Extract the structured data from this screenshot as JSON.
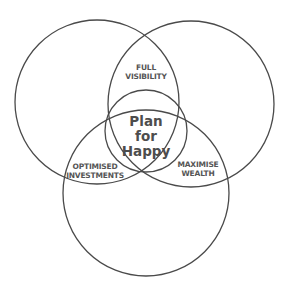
{
  "diagram": {
    "type": "venn",
    "circles": [
      {
        "id": "left",
        "cx": 97,
        "cy": 102,
        "r": 82
      },
      {
        "id": "right",
        "cx": 191,
        "cy": 104,
        "r": 83
      },
      {
        "id": "bottom",
        "cx": 146,
        "cy": 193,
        "r": 83
      },
      {
        "id": "center",
        "cx": 146,
        "cy": 131,
        "r": 41
      }
    ],
    "stroke_color": "#4a4a4a",
    "text_color": "#555555"
  },
  "labels": {
    "top_overlap": {
      "line1": "FULL",
      "line2": "VISIBILITY"
    },
    "left_overlap": {
      "line1": "OPTIMISED",
      "line2": "INVESTMENTS"
    },
    "right_overlap": {
      "line1": "MAXIMISE",
      "line2": "WEALTH"
    },
    "center": {
      "line1": "Plan",
      "line2": "for",
      "line3": "Happy"
    }
  }
}
